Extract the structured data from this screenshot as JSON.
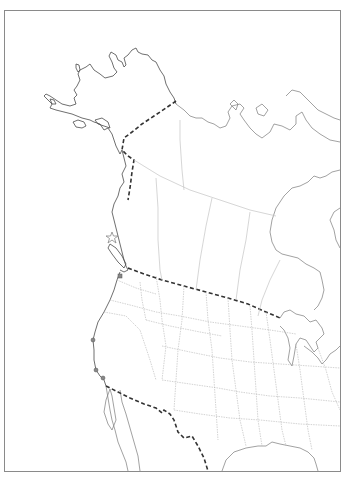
{
  "map": {
    "type": "outline-map",
    "region": "Western North America",
    "colors": {
      "background": "#ffffff",
      "frame": "#8a8a8a",
      "coastline": "#4a4a4a",
      "international_border": "#333333",
      "state_border": "#b5b5b5"
    },
    "markers": [
      {
        "shape": "star",
        "x": 112,
        "y": 238
      },
      {
        "shape": "square",
        "x": 120,
        "y": 276
      },
      {
        "shape": "dot",
        "x": 93,
        "y": 340
      },
      {
        "shape": "dot",
        "x": 96,
        "y": 370
      },
      {
        "shape": "dot",
        "x": 103,
        "y": 378
      }
    ]
  }
}
